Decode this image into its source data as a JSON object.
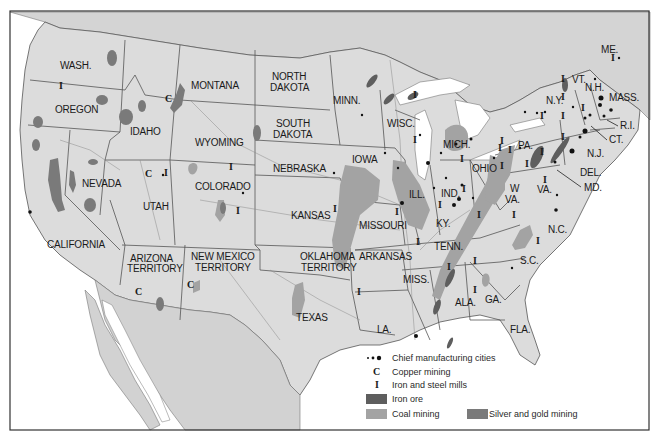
{
  "map": {
    "colors": {
      "land_us": "#dcdcdc",
      "land_foreign": "#d2d2d2",
      "water": "#ffffff",
      "iron_ore": "#666666",
      "coal_mining": "#a3a3a3",
      "silver_gold_mining": "#7a7a7a",
      "city_dot": "#111111",
      "frame": "#333333"
    },
    "states": [
      {
        "id": "wash",
        "label": "WASH."
      },
      {
        "id": "oregon",
        "label": "OREGON"
      },
      {
        "id": "california",
        "label": "CALIFORNIA"
      },
      {
        "id": "idaho",
        "label": "IDAHO"
      },
      {
        "id": "nevada",
        "label": "NEVADA"
      },
      {
        "id": "montana",
        "label": "MONTANA"
      },
      {
        "id": "wyoming",
        "label": "WYOMING"
      },
      {
        "id": "utah",
        "label": "UTAH"
      },
      {
        "id": "colorado",
        "label": "COLORADO"
      },
      {
        "id": "arizona1",
        "label": "ARIZONA"
      },
      {
        "id": "arizona2",
        "label": "TERRITORY"
      },
      {
        "id": "newmexico1",
        "label": "NEW MEXICO"
      },
      {
        "id": "newmexico2",
        "label": "TERRITORY"
      },
      {
        "id": "northdakota1",
        "label": "NORTH"
      },
      {
        "id": "northdakota2",
        "label": "DAKOTA"
      },
      {
        "id": "southdakota1",
        "label": "SOUTH"
      },
      {
        "id": "southdakota2",
        "label": "DAKOTA"
      },
      {
        "id": "nebraska",
        "label": "NEBRASKA"
      },
      {
        "id": "kansas",
        "label": "KANSAS"
      },
      {
        "id": "oklahoma1",
        "label": "OKLAHOMA"
      },
      {
        "id": "oklahoma2",
        "label": "TERRITORY"
      },
      {
        "id": "texas",
        "label": "TEXAS"
      },
      {
        "id": "minn",
        "label": "MINN."
      },
      {
        "id": "iowa",
        "label": "IOWA"
      },
      {
        "id": "missouri",
        "label": "MISSOURI"
      },
      {
        "id": "arkansas",
        "label": "ARKANSAS"
      },
      {
        "id": "la",
        "label": "LA."
      },
      {
        "id": "wisc",
        "label": "WISC."
      },
      {
        "id": "ill",
        "label": "ILL."
      },
      {
        "id": "mich",
        "label": "MICH."
      },
      {
        "id": "ind",
        "label": "IND."
      },
      {
        "id": "ohio",
        "label": "OHIO"
      },
      {
        "id": "ky",
        "label": "KY."
      },
      {
        "id": "tenn",
        "label": "TENN."
      },
      {
        "id": "miss",
        "label": "MISS."
      },
      {
        "id": "ala",
        "label": "ALA."
      },
      {
        "id": "ga",
        "label": "GA."
      },
      {
        "id": "fla",
        "label": "FLA."
      },
      {
        "id": "sc",
        "label": "S.C."
      },
      {
        "id": "nc",
        "label": "N.C."
      },
      {
        "id": "va",
        "label": "VA."
      },
      {
        "id": "wva1",
        "label": "W"
      },
      {
        "id": "wva2",
        "label": "VA."
      },
      {
        "id": "pa",
        "label": "PA."
      },
      {
        "id": "ny",
        "label": "N.Y."
      },
      {
        "id": "vt",
        "label": "VT."
      },
      {
        "id": "nh",
        "label": "N.H."
      },
      {
        "id": "me",
        "label": "ME."
      },
      {
        "id": "mass",
        "label": "MASS."
      },
      {
        "id": "ri",
        "label": "R.I."
      },
      {
        "id": "ct",
        "label": "CT."
      },
      {
        "id": "nj",
        "label": "N.J."
      },
      {
        "id": "del",
        "label": "DEL."
      },
      {
        "id": "md",
        "label": "MD."
      }
    ],
    "symbols": {
      "copper": "C",
      "iron_steel": "I"
    }
  },
  "legend": {
    "items": [
      {
        "key": "cities",
        "label": "Chief manufacturing cities"
      },
      {
        "key": "copper",
        "label": "Copper mining",
        "symbol": "C"
      },
      {
        "key": "iron_steel",
        "label": "Iron and steel mills",
        "symbol": "I"
      },
      {
        "key": "iron_ore",
        "label": "Iron ore"
      },
      {
        "key": "coal",
        "label": "Coal mining"
      },
      {
        "key": "silver_gold",
        "label": "Silver and gold mining"
      }
    ]
  }
}
